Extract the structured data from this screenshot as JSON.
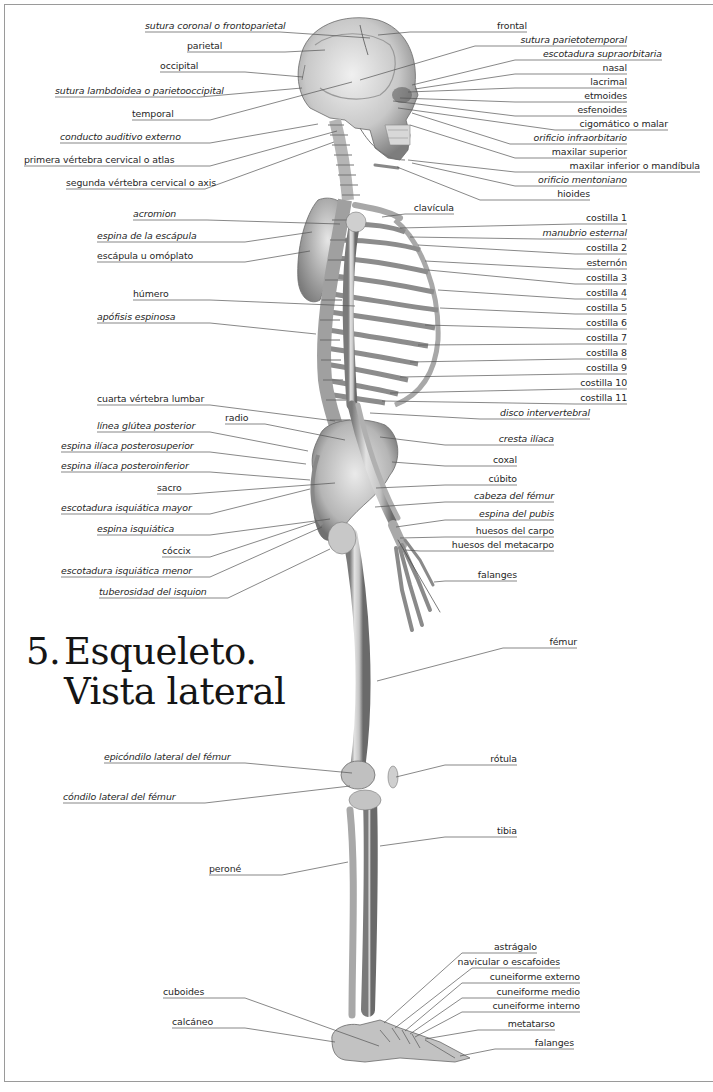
{
  "title": {
    "number": "5.",
    "line1": "Esqueleto.",
    "line2": "Vista lateral"
  },
  "colors": {
    "bone_light": "#e4e4e4",
    "bone_mid": "#b8b8b8",
    "bone_dark": "#6e6e6e",
    "leader_line": "#555555",
    "frame": "#9a9a9a",
    "text": "#1f1f1f"
  },
  "labels_left": [
    {
      "id": "sutura-coronal",
      "text": "sutura coronal o frontoparietal",
      "italic": true,
      "x": 145,
      "y": 20,
      "ux0": 145,
      "ux1": 280,
      "tx": 370,
      "ty": 38
    },
    {
      "id": "parietal",
      "text": "parietal",
      "italic": false,
      "x": 187,
      "y": 40,
      "ux0": 187,
      "ux1": 285,
      "tx": 325,
      "ty": 50
    },
    {
      "id": "occipital",
      "text": "occipital",
      "italic": false,
      "x": 160,
      "y": 60,
      "ux0": 160,
      "ux1": 245,
      "tx": 303,
      "ty": 77
    },
    {
      "id": "sutura-lambdoidea",
      "text": "sutura lambdoidea o parietooccipital",
      "italic": true,
      "x": 55,
      "y": 85,
      "ux0": 55,
      "ux1": 200,
      "tx": 302,
      "ty": 88
    },
    {
      "id": "temporal",
      "text": "temporal",
      "italic": false,
      "x": 132,
      "y": 108,
      "ux0": 132,
      "ux1": 210,
      "tx": 352,
      "ty": 82
    },
    {
      "id": "conducto-auditivo",
      "text": "conducto auditivo externo",
      "italic": true,
      "x": 60,
      "y": 131,
      "ux0": 60,
      "ux1": 210,
      "tx": 318,
      "ty": 124
    },
    {
      "id": "atlas",
      "text": "primera vértebra cervical o atlas",
      "italic": false,
      "x": 24,
      "y": 154,
      "ux0": 24,
      "ux1": 210,
      "tx": 337,
      "ty": 131
    },
    {
      "id": "axis",
      "text": "segunda vértebra cervical o axis",
      "italic": false,
      "x": 66,
      "y": 177,
      "ux0": 66,
      "ux1": 205,
      "tx": 334,
      "ty": 142
    },
    {
      "id": "acromion",
      "text": "acromion",
      "italic": true,
      "x": 133,
      "y": 208,
      "ux0": 133,
      "ux1": 207,
      "tx": 340,
      "ty": 224
    },
    {
      "id": "espina-escapula",
      "text": "espina de la escápula",
      "italic": true,
      "x": 97,
      "y": 230,
      "ux0": 97,
      "ux1": 245,
      "tx": 312,
      "ty": 232
    },
    {
      "id": "escapula",
      "text": "escápula u omóplato",
      "italic": false,
      "x": 97,
      "y": 250,
      "ux0": 97,
      "ux1": 245,
      "tx": 310,
      "ty": 251
    },
    {
      "id": "humero",
      "text": "húmero",
      "italic": false,
      "x": 133,
      "y": 288,
      "ux0": 133,
      "ux1": 210,
      "tx": 355,
      "ty": 306
    },
    {
      "id": "apofisis-espinosa",
      "text": "apófisis espinosa",
      "italic": true,
      "x": 97,
      "y": 311,
      "ux0": 97,
      "ux1": 210,
      "tx": 316,
      "ty": 334
    },
    {
      "id": "cuarta-lumbar",
      "text": "cuarta vértebra lumbar",
      "italic": false,
      "x": 97,
      "y": 393,
      "ux0": 97,
      "ux1": 210,
      "tx": 335,
      "ty": 421
    },
    {
      "id": "linea-glutea",
      "text": "línea glútea posterior",
      "italic": true,
      "x": 97,
      "y": 420,
      "ux0": 97,
      "ux1": 210,
      "tx": 308,
      "ty": 451
    },
    {
      "id": "espina-posterosuperior",
      "text": "espina ilíaca posterosuperior",
      "italic": true,
      "x": 61,
      "y": 440,
      "ux0": 61,
      "ux1": 210,
      "tx": 306,
      "ty": 464
    },
    {
      "id": "espina-posteroinferior",
      "text": "espina ilíaca posteroinferior",
      "italic": true,
      "x": 61,
      "y": 460,
      "ux0": 61,
      "ux1": 210,
      "tx": 310,
      "ty": 480
    },
    {
      "id": "sacro",
      "text": "sacro",
      "italic": false,
      "x": 157,
      "y": 482,
      "ux0": 157,
      "ux1": 190,
      "tx": 335,
      "ty": 483
    },
    {
      "id": "escotadura-mayor",
      "text": "escotadura isquiática mayor",
      "italic": true,
      "x": 61,
      "y": 502,
      "ux0": 61,
      "ux1": 210,
      "tx": 310,
      "ty": 489
    },
    {
      "id": "espina-isquiatica",
      "text": "espina isquiática",
      "italic": true,
      "x": 97,
      "y": 523,
      "ux0": 97,
      "ux1": 210,
      "tx": 330,
      "ty": 519
    },
    {
      "id": "coccix",
      "text": "cóccix",
      "italic": false,
      "x": 162,
      "y": 545,
      "ux0": 162,
      "ux1": 210,
      "tx": 316,
      "ty": 522
    },
    {
      "id": "escotadura-menor",
      "text": "escotadura isquiática menor",
      "italic": true,
      "x": 61,
      "y": 565,
      "ux0": 61,
      "ux1": 210,
      "tx": 322,
      "ty": 527
    },
    {
      "id": "tuberosidad-isquion",
      "text": "tuberosidad del isquion",
      "italic": true,
      "x": 99,
      "y": 586,
      "ux0": 99,
      "ux1": 228,
      "tx": 330,
      "ty": 549
    },
    {
      "id": "epicondilo",
      "text": "epicóndilo lateral del fémur",
      "italic": true,
      "x": 104,
      "y": 751,
      "ux0": 104,
      "ux1": 245,
      "tx": 352,
      "ty": 773
    },
    {
      "id": "condilo",
      "text": "cóndilo lateral del fémur",
      "italic": true,
      "x": 63,
      "y": 791,
      "ux0": 63,
      "ux1": 205,
      "tx": 350,
      "ty": 786
    },
    {
      "id": "perone",
      "text": "peroné",
      "italic": false,
      "x": 209,
      "y": 863,
      "ux0": 209,
      "ux1": 282,
      "tx": 348,
      "ty": 862
    },
    {
      "id": "cuboides",
      "text": "cuboides",
      "italic": false,
      "x": 163,
      "y": 986,
      "ux0": 163,
      "ux1": 245,
      "tx": 379,
      "ty": 1046
    },
    {
      "id": "calcaneo",
      "text": "calcáneo",
      "italic": false,
      "x": 172,
      "y": 1016,
      "ux0": 172,
      "ux1": 245,
      "tx": 335,
      "ty": 1042
    }
  ],
  "labels_right": [
    {
      "id": "frontal",
      "text": "frontal",
      "italic": false,
      "rx": 527,
      "y": 20,
      "ux0": 410,
      "ux1": 527,
      "tx": 378,
      "ty": 35
    },
    {
      "id": "sutura-parietotemporal",
      "text": "sutura parietotemporal",
      "italic": true,
      "rx": 627,
      "y": 34,
      "ux0": 475,
      "ux1": 627,
      "tx": 360,
      "ty": 80
    },
    {
      "id": "escotadura-supraorbitaria",
      "text": "escotadura supraorbitaria",
      "italic": true,
      "rx": 662,
      "y": 48,
      "ux0": 515,
      "ux1": 662,
      "tx": 412,
      "ty": 85
    },
    {
      "id": "nasal",
      "text": "nasal",
      "italic": false,
      "rx": 627,
      "y": 62,
      "ux0": 515,
      "ux1": 627,
      "tx": 415,
      "ty": 89
    },
    {
      "id": "lacrimal",
      "text": "lacrimal",
      "italic": false,
      "rx": 627,
      "y": 76,
      "ux0": 515,
      "ux1": 627,
      "tx": 408,
      "ty": 92
    },
    {
      "id": "etmoides",
      "text": "etmoides",
      "italic": false,
      "rx": 627,
      "y": 90,
      "ux0": 515,
      "ux1": 627,
      "tx": 400,
      "ty": 98
    },
    {
      "id": "esfenoides",
      "text": "esfenoides",
      "italic": false,
      "rx": 627,
      "y": 104,
      "ux0": 515,
      "ux1": 627,
      "tx": 393,
      "ty": 101
    },
    {
      "id": "cigomatico",
      "text": "cigomático o malar",
      "italic": false,
      "rx": 668,
      "y": 118,
      "ux0": 555,
      "ux1": 668,
      "tx": 398,
      "ty": 108
    },
    {
      "id": "orificio-infraorbitario",
      "text": "orificio infraorbitario",
      "italic": true,
      "rx": 627,
      "y": 132,
      "ux0": 510,
      "ux1": 627,
      "tx": 412,
      "ty": 113
    },
    {
      "id": "maxilar-superior",
      "text": "maxilar superior",
      "italic": false,
      "rx": 627,
      "y": 146,
      "ux0": 515,
      "ux1": 627,
      "tx": 410,
      "ty": 125
    },
    {
      "id": "maxilar-inferior",
      "text": "maxilar inferior o mandíbula",
      "italic": false,
      "rx": 700,
      "y": 160,
      "ux0": 515,
      "ux1": 700,
      "tx": 408,
      "ty": 160
    },
    {
      "id": "orificio-mentoniano",
      "text": "orificio mentoniano",
      "italic": true,
      "rx": 627,
      "y": 174,
      "ux0": 515,
      "ux1": 627,
      "tx": 412,
      "ty": 163
    },
    {
      "id": "hioides",
      "text": "hioides",
      "italic": false,
      "rx": 590,
      "y": 188,
      "ux0": 480,
      "ux1": 590,
      "tx": 397,
      "ty": 167
    },
    {
      "id": "clavicula",
      "text": "clavícula",
      "italic": false,
      "rx": 454,
      "y": 202,
      "ux0": 405,
      "ux1": 454,
      "tx": 382,
      "ty": 217
    },
    {
      "id": "costilla-1",
      "text": "costilla 1",
      "italic": false,
      "rx": 627,
      "y": 212,
      "ux0": 575,
      "ux1": 627,
      "tx": 400,
      "ty": 228
    },
    {
      "id": "manubrio",
      "text": "manubrio esternal",
      "italic": true,
      "rx": 627,
      "y": 227,
      "ux0": 540,
      "ux1": 627,
      "tx": 410,
      "ty": 237
    },
    {
      "id": "costilla-2",
      "text": "costilla 2",
      "italic": false,
      "rx": 627,
      "y": 242,
      "ux0": 575,
      "ux1": 627,
      "tx": 418,
      "ty": 245
    },
    {
      "id": "esternon",
      "text": "esternón",
      "italic": false,
      "rx": 627,
      "y": 257,
      "ux0": 575,
      "ux1": 627,
      "tx": 425,
      "ty": 261
    },
    {
      "id": "costilla-3",
      "text": "costilla 3",
      "italic": false,
      "rx": 627,
      "y": 272,
      "ux0": 575,
      "ux1": 627,
      "tx": 428,
      "ty": 270
    },
    {
      "id": "costilla-4",
      "text": "costilla 4",
      "italic": false,
      "rx": 627,
      "y": 287,
      "ux0": 575,
      "ux1": 627,
      "tx": 438,
      "ty": 290
    },
    {
      "id": "costilla-5",
      "text": "costilla 5",
      "italic": false,
      "rx": 627,
      "y": 302,
      "ux0": 575,
      "ux1": 627,
      "tx": 440,
      "ty": 308
    },
    {
      "id": "costilla-6",
      "text": "costilla 6",
      "italic": false,
      "rx": 627,
      "y": 317,
      "ux0": 575,
      "ux1": 627,
      "tx": 425,
      "ty": 325
    },
    {
      "id": "costilla-7",
      "text": "costilla 7",
      "italic": false,
      "rx": 627,
      "y": 332,
      "ux0": 575,
      "ux1": 627,
      "tx": 418,
      "ty": 345
    },
    {
      "id": "costilla-8",
      "text": "costilla 8",
      "italic": false,
      "rx": 627,
      "y": 347,
      "ux0": 575,
      "ux1": 627,
      "tx": 410,
      "ty": 362
    },
    {
      "id": "costilla-9",
      "text": "costilla 9",
      "italic": false,
      "rx": 627,
      "y": 362,
      "ux0": 575,
      "ux1": 627,
      "tx": 400,
      "ty": 377
    },
    {
      "id": "costilla-10",
      "text": "costilla 10",
      "italic": false,
      "rx": 627,
      "y": 377,
      "ux0": 575,
      "ux1": 627,
      "tx": 390,
      "ty": 393
    },
    {
      "id": "costilla-11",
      "text": "costilla 11",
      "italic": false,
      "rx": 627,
      "y": 392,
      "ux0": 575,
      "ux1": 627,
      "tx": 382,
      "ty": 401
    },
    {
      "id": "disco-intervertebral",
      "text": "disco intervertebral",
      "italic": true,
      "rx": 590,
      "y": 407,
      "ux0": 480,
      "ux1": 590,
      "tx": 370,
      "ty": 413
    },
    {
      "id": "radio",
      "text": "radio",
      "italic": false,
      "rx": 246,
      "y": 412,
      "ux0": 225,
      "ux1": 265,
      "tx": 345,
      "ty": 440,
      "anchor_left": true,
      "lx": 225
    },
    {
      "id": "cresta-iliaca",
      "text": "cresta ilíaca",
      "italic": true,
      "rx": 554,
      "y": 433,
      "ux0": 445,
      "ux1": 554,
      "tx": 380,
      "ty": 437
    },
    {
      "id": "coxal",
      "text": "coxal",
      "italic": false,
      "rx": 517,
      "y": 454,
      "ux0": 445,
      "ux1": 517,
      "tx": 392,
      "ty": 462
    },
    {
      "id": "cubito",
      "text": "cúbito",
      "italic": false,
      "rx": 517,
      "y": 473,
      "ux0": 445,
      "ux1": 517,
      "tx": 376,
      "ty": 488
    },
    {
      "id": "cabeza-femur",
      "text": "cabeza del fémur",
      "italic": true,
      "rx": 554,
      "y": 490,
      "ux0": 445,
      "ux1": 554,
      "tx": 375,
      "ty": 507
    },
    {
      "id": "espina-pubis",
      "text": "espina del pubis",
      "italic": true,
      "rx": 554,
      "y": 508,
      "ux0": 445,
      "ux1": 554,
      "tx": 396,
      "ty": 527
    },
    {
      "id": "huesos-carpo",
      "text": "huesos del carpo",
      "italic": false,
      "rx": 554,
      "y": 525,
      "ux0": 445,
      "ux1": 554,
      "tx": 400,
      "ty": 538
    },
    {
      "id": "huesos-metacarpo",
      "text": "huesos del metacarpo",
      "italic": false,
      "rx": 554,
      "y": 539,
      "ux0": 420,
      "ux1": 554,
      "tx": 405,
      "ty": 550
    },
    {
      "id": "falanges-mano",
      "text": "falanges",
      "italic": false,
      "rx": 517,
      "y": 569,
      "ux0": 445,
      "ux1": 517,
      "tx": 434,
      "ty": 582
    },
    {
      "id": "femur",
      "text": "fémur",
      "italic": false,
      "rx": 577,
      "y": 636,
      "ux0": 503,
      "ux1": 577,
      "tx": 377,
      "ty": 681
    },
    {
      "id": "rotula",
      "text": "rótula",
      "italic": false,
      "rx": 517,
      "y": 753,
      "ux0": 445,
      "ux1": 517,
      "tx": 396,
      "ty": 777
    },
    {
      "id": "tibia",
      "text": "tibia",
      "italic": false,
      "rx": 517,
      "y": 825,
      "ux0": 445,
      "ux1": 517,
      "tx": 380,
      "ty": 846
    },
    {
      "id": "astragalo",
      "text": "astrágalo",
      "italic": false,
      "rx": 537,
      "y": 941,
      "ux0": 462,
      "ux1": 537,
      "tx": 384,
      "ty": 1023
    },
    {
      "id": "navicular",
      "text": "navicular o escafoides",
      "italic": false,
      "rx": 560,
      "y": 956,
      "ux0": 472,
      "ux1": 560,
      "tx": 395,
      "ty": 1028
    },
    {
      "id": "cuneiforme-externo",
      "text": "cuneiforme externo",
      "italic": false,
      "rx": 580,
      "y": 971,
      "ux0": 462,
      "ux1": 580,
      "tx": 405,
      "ty": 1031
    },
    {
      "id": "cuneiforme-medio",
      "text": "cuneiforme medio",
      "italic": false,
      "rx": 580,
      "y": 986,
      "ux0": 462,
      "ux1": 580,
      "tx": 410,
      "ty": 1034
    },
    {
      "id": "cuneiforme-interno",
      "text": "cuneiforme interno",
      "italic": false,
      "rx": 580,
      "y": 1000,
      "ux0": 462,
      "ux1": 580,
      "tx": 415,
      "ty": 1037
    },
    {
      "id": "metatarso",
      "text": "metatarso",
      "italic": false,
      "rx": 555,
      "y": 1018,
      "ux0": 478,
      "ux1": 555,
      "tx": 425,
      "ty": 1039
    },
    {
      "id": "falanges-pie",
      "text": "falanges",
      "italic": false,
      "rx": 574,
      "y": 1037,
      "ux0": 495,
      "ux1": 574,
      "tx": 460,
      "ty": 1056
    }
  ]
}
